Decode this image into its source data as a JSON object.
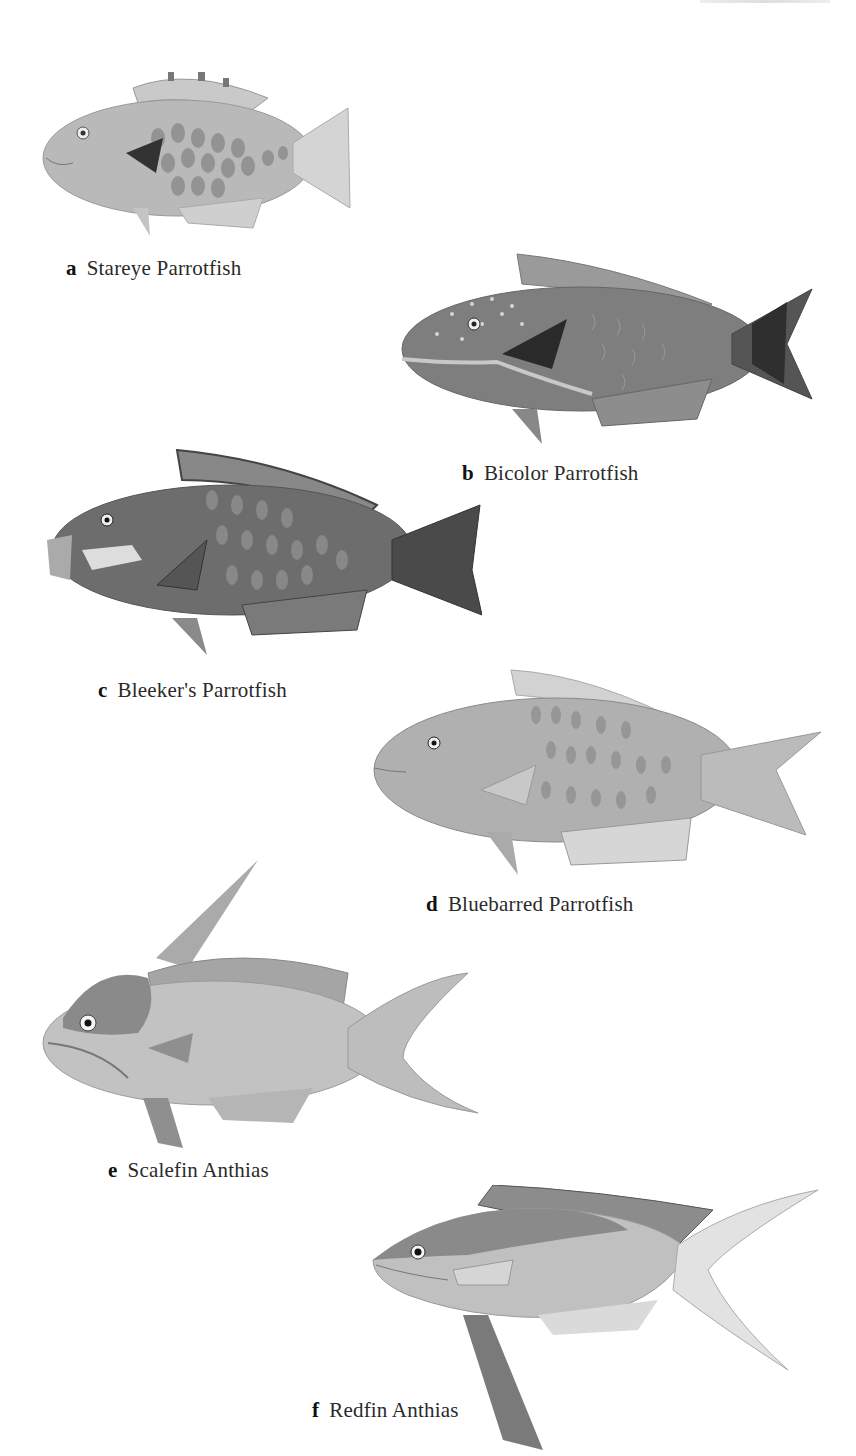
{
  "plate": {
    "background": "#ffffff",
    "items": [
      {
        "letter": "a",
        "name": "Stareye Parrotfish"
      },
      {
        "letter": "b",
        "name": "Bicolor Parrotfish"
      },
      {
        "letter": "c",
        "name": "Bleeker's Parrotfish"
      },
      {
        "letter": "d",
        "name": "Bluebarred Parrotfish"
      },
      {
        "letter": "e",
        "name": "Scalefin Anthias"
      },
      {
        "letter": "f",
        "name": "Redfin Anthias"
      }
    ]
  }
}
